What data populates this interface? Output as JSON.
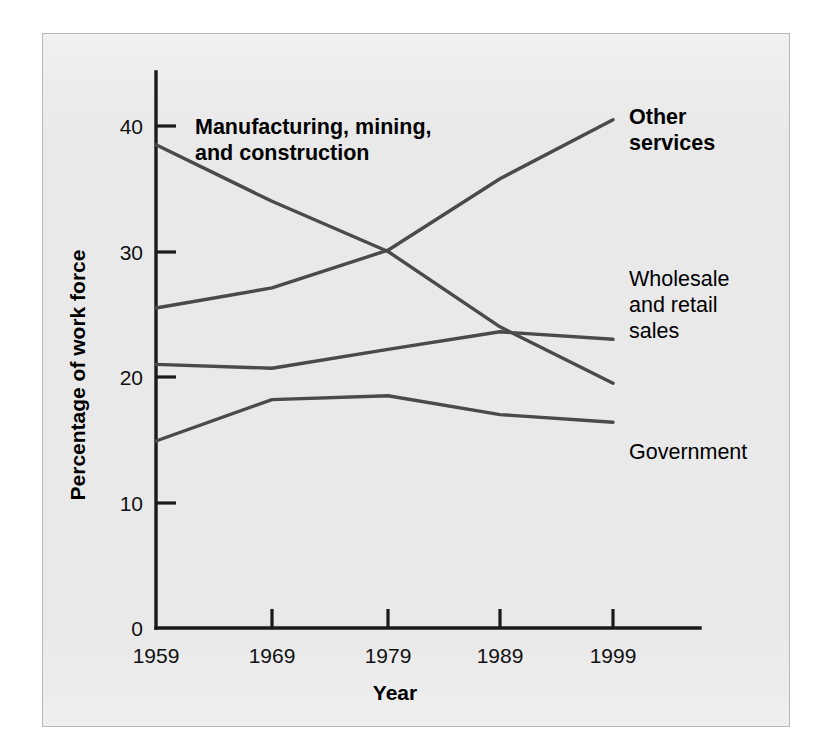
{
  "chart_data": {
    "type": "line",
    "title": "",
    "xlabel": "Year",
    "ylabel": "Percentage of work force",
    "x": [
      1959,
      1969,
      1979,
      1989,
      1999
    ],
    "categories": [
      "1959",
      "1969",
      "1979",
      "1989",
      "1999"
    ],
    "xtick_labels": [
      "1959",
      "1969",
      "1979",
      "1989",
      "1999"
    ],
    "ytick_labels": [
      "0",
      "10",
      "20",
      "30",
      "40"
    ],
    "yticks": [
      0,
      10,
      20,
      30,
      40
    ],
    "ylim": [
      0,
      44
    ],
    "xlim": [
      1959,
      1999
    ],
    "grid": false,
    "legend": "inline-labels-right",
    "series": [
      {
        "name": "Manufacturing, mining, and construction",
        "label_lines": [
          "Manufacturing, mining,",
          "and construction"
        ],
        "label_position": "inside-top-left",
        "label_bold": true,
        "values": [
          38.5,
          34.0,
          30.0,
          24.0,
          19.5
        ],
        "color": "#4a4a4a"
      },
      {
        "name": "Other services",
        "label_lines": [
          "Other",
          "services"
        ],
        "label_position": "right-top",
        "label_bold": true,
        "values": [
          25.5,
          27.1,
          30.1,
          35.8,
          40.5
        ],
        "color": "#4a4a4a"
      },
      {
        "name": "Wholesale and retail sales",
        "label_lines": [
          "Wholesale",
          "and retail",
          "sales"
        ],
        "label_position": "right-middle",
        "label_bold": false,
        "values": [
          21.0,
          20.7,
          22.2,
          23.6,
          23.0
        ],
        "color": "#4a4a4a"
      },
      {
        "name": "Government",
        "label_lines": [
          "Government"
        ],
        "label_position": "right-bottom",
        "label_bold": false,
        "values": [
          14.9,
          18.2,
          18.5,
          17.0,
          16.4
        ],
        "color": "#4a4a4a"
      }
    ]
  },
  "axes": {
    "y_title": "Percentage of work force",
    "x_title": "Year",
    "y_ticks": [
      "40",
      "30",
      "20",
      "10",
      "0"
    ],
    "x_ticks": [
      "1959",
      "1969",
      "1979",
      "1989",
      "1999"
    ]
  },
  "labels": {
    "manufacturing_line1": "Manufacturing, mining,",
    "manufacturing_line2": "and construction",
    "other_line1": "Other",
    "other_line2": "services",
    "wholesale_line1": "Wholesale",
    "wholesale_line2": "and retail",
    "wholesale_line3": "sales",
    "government_line1": "Government"
  },
  "colors": {
    "panel_background": "#e9e9e9",
    "page_background": "#ffffff",
    "panel_border": "#b9b9b9",
    "axis": "#1a1a1a",
    "series_line": "#4a4a4a",
    "text": "#000000"
  }
}
